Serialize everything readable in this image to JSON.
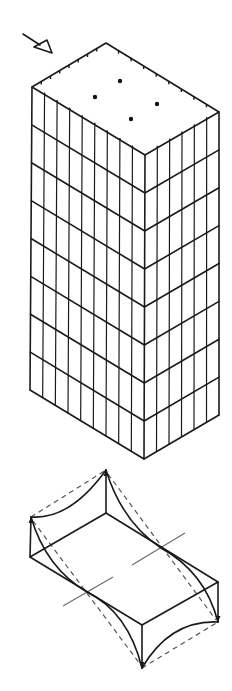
{
  "figure": {
    "width": 232,
    "height": 691,
    "background": "#ffffff",
    "stroke_color": "#1a1a1a"
  },
  "wind_arrow": {
    "label": "wind-load-arrow",
    "tail": [
      23,
      34
    ],
    "shaft_end": [
      40,
      45
    ],
    "head": [
      [
        34,
        47
      ],
      [
        52,
        53
      ],
      [
        47,
        40
      ]
    ]
  },
  "tower": {
    "roof": {
      "back": [
        106,
        43
      ],
      "left": [
        32,
        87
      ],
      "front": [
        145,
        155
      ],
      "right": [
        219,
        112
      ]
    },
    "base": {
      "left": [
        30,
        390
      ],
      "front": [
        144,
        459
      ],
      "right": [
        219,
        415
      ]
    },
    "floors": 8,
    "left_face_bays": 9,
    "right_face_bays": 6,
    "roof_dots": [
      [
        95,
        97
      ],
      [
        120,
        81
      ],
      [
        131,
        119
      ],
      [
        157,
        104
      ]
    ],
    "roof_tick_count_left_edge": 7,
    "roof_tick_count_right_edge": 8
  },
  "deformed_slab": {
    "top_face": {
      "back": [
        106,
        513
      ],
      "left": [
        30,
        557
      ],
      "front": [
        142,
        625
      ],
      "right": [
        218,
        582
      ]
    },
    "cusps": {
      "top": [
        106,
        470
      ],
      "left": [
        31,
        517
      ],
      "bottom": [
        142,
        668
      ],
      "right": [
        218,
        622
      ]
    },
    "axis_lines": [
      {
        "from": [
          63,
          606
        ],
        "to": [
          113,
          577
        ]
      },
      {
        "from": [
          132,
          565
        ],
        "to": [
          185,
          533
        ]
      }
    ],
    "inflection_points": [
      [
        87,
        592
      ],
      [
        161,
        548
      ]
    ]
  }
}
